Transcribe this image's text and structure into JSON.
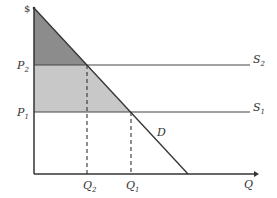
{
  "diagram": {
    "type": "supply-demand",
    "axes": {
      "y_label": "$",
      "x_label": "Q"
    },
    "prices": [
      {
        "label": "P",
        "sub": "2",
        "supply_label": "S",
        "supply_sub": "2"
      },
      {
        "label": "P",
        "sub": "1",
        "supply_label": "S",
        "supply_sub": "1"
      }
    ],
    "quantities": [
      {
        "label": "Q",
        "sub": "2"
      },
      {
        "label": "Q",
        "sub": "1"
      }
    ],
    "demand_label": "D",
    "colors": {
      "dark_region": "#8c8c8c",
      "light_region": "#c8c8c8",
      "line": "#333333"
    }
  }
}
